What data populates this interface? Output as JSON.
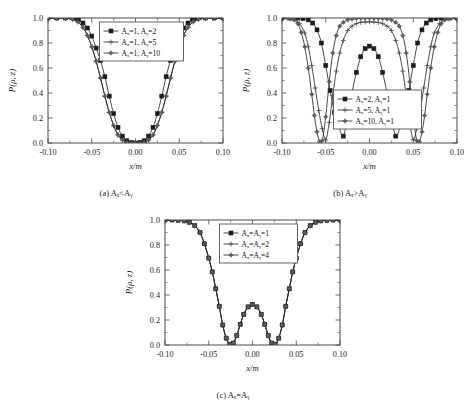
{
  "figure": {
    "background": "#ffffff",
    "line_color": "#2b2b2b",
    "axis_color": "#4a4a4a",
    "bottom_partial_text": ""
  },
  "panels": [
    {
      "id": "a",
      "caption": "(a)  Aₓ<Aᵧ",
      "caption_parts": {
        "tag": "(a)",
        "expr": "Ax<Ay"
      },
      "xlabel": "x/m",
      "ylabel": "P(ρ, z)",
      "xticks": [
        "-0.10",
        "-0.05",
        "0.00",
        "0.05",
        "0.10"
      ],
      "yticks": [
        "0.0",
        "0.2",
        "0.4",
        "0.6",
        "0.8",
        "1.0"
      ],
      "legend": [
        {
          "label": "Aₓ=1, Aᵧ=2",
          "marker": "square"
        },
        {
          "label": "Aₓ=1, Aᵧ=5",
          "marker": "plus"
        },
        {
          "label": "Aₓ=1, Aᵧ=10",
          "marker": "star"
        }
      ]
    },
    {
      "id": "b",
      "caption": "(b)  Aₓ>Aᵧ",
      "caption_parts": {
        "tag": "(b)",
        "expr": "Ax>Ay"
      },
      "xlabel": "x/m",
      "ylabel": "P(ρ, z)",
      "xticks": [
        "-0.10",
        "-0.05",
        "0.00",
        "0.05",
        "0.10"
      ],
      "yticks": [
        "0.0",
        "0.2",
        "0.4",
        "0.6",
        "0.8",
        "1.0"
      ],
      "legend": [
        {
          "label": "Aₓ=2, Aᵧ=1",
          "marker": "square"
        },
        {
          "label": "Aₓ=5, Aᵧ=1",
          "marker": "plus"
        },
        {
          "label": "Aₓ=10, Aᵧ=1",
          "marker": "star"
        }
      ]
    },
    {
      "id": "c",
      "caption": "(c)  Aₓ=Aᵧ",
      "caption_parts": {
        "tag": "(c)",
        "expr": "Ax=Ay"
      },
      "xlabel": "x/m",
      "ylabel": "P(ρ, z)",
      "xticks": [
        "-0.10",
        "-0.05",
        "0.00",
        "0.05",
        "0.10"
      ],
      "yticks": [
        "0.0",
        "0.2",
        "0.4",
        "0.6",
        "0.8",
        "1.0"
      ],
      "legend": [
        {
          "label": "Aₓ=Aᵧ=1",
          "marker": "square"
        },
        {
          "label": "Aₓ=Aᵧ=2",
          "marker": "plus"
        },
        {
          "label": "Aₓ=Aᵧ=4",
          "marker": "star"
        }
      ]
    }
  ],
  "chart_data": [
    {
      "type": "line",
      "panel": "a",
      "title": "(a) Ax<Ay",
      "xlabel": "x/m",
      "ylabel": "P(rho, z)",
      "xlim": [
        -0.1,
        0.1
      ],
      "ylim": [
        0.0,
        1.0
      ],
      "xticks": [
        -0.1,
        -0.05,
        0.0,
        0.05,
        0.1
      ],
      "yticks": [
        0.0,
        0.2,
        0.4,
        0.6,
        0.8,
        1.0
      ],
      "grid": false,
      "legend_position": "top-center",
      "series": [
        {
          "name": "Ax=1, Ay=2",
          "marker": "square",
          "x": [
            -0.1,
            -0.09,
            -0.08,
            -0.07,
            -0.065,
            -0.06,
            -0.055,
            -0.05,
            -0.045,
            -0.04,
            -0.035,
            -0.03,
            -0.025,
            -0.02,
            -0.015,
            -0.01,
            -0.005,
            0.0,
            0.005,
            0.01,
            0.015,
            0.02,
            0.025,
            0.03,
            0.035,
            0.04,
            0.045,
            0.05,
            0.055,
            0.06,
            0.065,
            0.07,
            0.08,
            0.09,
            0.1
          ],
          "y": [
            1.0,
            1.0,
            1.0,
            0.995,
            0.985,
            0.96,
            0.92,
            0.855,
            0.76,
            0.66,
            0.53,
            0.375,
            0.235,
            0.125,
            0.055,
            0.018,
            0.004,
            0.0,
            0.004,
            0.018,
            0.055,
            0.125,
            0.235,
            0.375,
            0.53,
            0.66,
            0.76,
            0.855,
            0.92,
            0.96,
            0.985,
            0.995,
            1.0,
            1.0,
            1.0
          ]
        },
        {
          "name": "Ax=1, Ay=5",
          "marker": "plus",
          "x": [
            -0.1,
            -0.09,
            -0.08,
            -0.072,
            -0.066,
            -0.06,
            -0.055,
            -0.05,
            -0.045,
            -0.04,
            -0.035,
            -0.03,
            -0.025,
            -0.02,
            -0.015,
            -0.01,
            -0.005,
            0.0,
            0.005,
            0.01,
            0.015,
            0.02,
            0.025,
            0.03,
            0.035,
            0.04,
            0.045,
            0.05,
            0.055,
            0.06,
            0.066,
            0.072,
            0.08,
            0.09,
            0.1
          ],
          "y": [
            1.0,
            1.0,
            0.998,
            0.99,
            0.97,
            0.925,
            0.86,
            0.77,
            0.655,
            0.52,
            0.375,
            0.245,
            0.14,
            0.065,
            0.025,
            0.006,
            0.001,
            0.0,
            0.001,
            0.006,
            0.025,
            0.065,
            0.14,
            0.245,
            0.375,
            0.52,
            0.655,
            0.77,
            0.86,
            0.925,
            0.97,
            0.99,
            0.998,
            1.0,
            1.0
          ]
        },
        {
          "name": "Ax=1, Ay=10",
          "marker": "star",
          "x": [
            -0.1,
            -0.09,
            -0.08,
            -0.072,
            -0.066,
            -0.06,
            -0.055,
            -0.05,
            -0.045,
            -0.04,
            -0.035,
            -0.03,
            -0.025,
            -0.02,
            -0.015,
            -0.01,
            -0.005,
            0.0,
            0.005,
            0.01,
            0.015,
            0.02,
            0.025,
            0.03,
            0.035,
            0.04,
            0.045,
            0.05,
            0.055,
            0.06,
            0.066,
            0.072,
            0.08,
            0.09,
            0.1
          ],
          "y": [
            1.0,
            1.0,
            0.998,
            0.99,
            0.97,
            0.925,
            0.86,
            0.77,
            0.655,
            0.52,
            0.375,
            0.245,
            0.14,
            0.065,
            0.025,
            0.006,
            0.001,
            0.0,
            0.001,
            0.006,
            0.025,
            0.065,
            0.14,
            0.245,
            0.375,
            0.52,
            0.655,
            0.77,
            0.86,
            0.925,
            0.97,
            0.99,
            0.998,
            1.0,
            1.0
          ]
        }
      ]
    },
    {
      "type": "line",
      "panel": "b",
      "title": "(b) Ax>Ay",
      "xlabel": "x/m",
      "ylabel": "P(rho, z)",
      "xlim": [
        -0.1,
        0.1
      ],
      "ylim": [
        0.0,
        1.0
      ],
      "xticks": [
        -0.1,
        -0.05,
        0.0,
        0.05,
        0.1
      ],
      "yticks": [
        0.0,
        0.2,
        0.4,
        0.6,
        0.8,
        1.0
      ],
      "grid": false,
      "legend_position": "bottom-center",
      "series": [
        {
          "name": "Ax=2, Ay=1",
          "marker": "square",
          "x": [
            -0.1,
            -0.09,
            -0.082,
            -0.076,
            -0.07,
            -0.065,
            -0.06,
            -0.055,
            -0.05,
            -0.045,
            -0.04,
            -0.035,
            -0.03,
            -0.025,
            -0.02,
            -0.015,
            -0.01,
            -0.005,
            0.0,
            0.005,
            0.01,
            0.015,
            0.02,
            0.025,
            0.03,
            0.035,
            0.04,
            0.045,
            0.05,
            0.055,
            0.06,
            0.065,
            0.07,
            0.076,
            0.082,
            0.09,
            0.1
          ],
          "y": [
            1.0,
            1.0,
            0.999,
            0.995,
            0.985,
            0.96,
            0.905,
            0.8,
            0.62,
            0.42,
            0.245,
            0.13,
            0.055,
            0.21,
            0.4,
            0.565,
            0.69,
            0.755,
            0.775,
            0.755,
            0.69,
            0.565,
            0.4,
            0.21,
            0.055,
            0.13,
            0.245,
            0.42,
            0.62,
            0.8,
            0.905,
            0.96,
            0.985,
            0.995,
            0.999,
            1.0,
            1.0
          ]
        },
        {
          "name": "Ax=5, Ay=1",
          "marker": "plus",
          "x": [
            -0.1,
            -0.092,
            -0.086,
            -0.08,
            -0.074,
            -0.07,
            -0.066,
            -0.062,
            -0.058,
            -0.054,
            -0.05,
            -0.046,
            -0.042,
            -0.038,
            -0.034,
            -0.03,
            -0.025,
            -0.02,
            -0.015,
            -0.01,
            -0.005,
            0.0,
            0.005,
            0.01,
            0.015,
            0.02,
            0.025,
            0.03,
            0.034,
            0.038,
            0.042,
            0.046,
            0.05,
            0.054,
            0.058,
            0.062,
            0.066,
            0.07,
            0.074,
            0.08,
            0.086,
            0.092,
            0.1
          ],
          "y": [
            1.0,
            0.998,
            0.99,
            0.955,
            0.88,
            0.77,
            0.62,
            0.44,
            0.26,
            0.115,
            0.025,
            0.165,
            0.38,
            0.575,
            0.72,
            0.82,
            0.9,
            0.935,
            0.955,
            0.965,
            0.968,
            0.97,
            0.968,
            0.965,
            0.955,
            0.935,
            0.9,
            0.82,
            0.72,
            0.575,
            0.38,
            0.165,
            0.025,
            0.115,
            0.26,
            0.44,
            0.62,
            0.77,
            0.88,
            0.955,
            0.99,
            0.998,
            1.0
          ]
        },
        {
          "name": "Ax=10, Ay=1",
          "marker": "star",
          "x": [
            -0.1,
            -0.094,
            -0.09,
            -0.086,
            -0.082,
            -0.078,
            -0.074,
            -0.07,
            -0.066,
            -0.063,
            -0.06,
            -0.057,
            -0.054,
            -0.05,
            -0.046,
            -0.042,
            -0.038,
            -0.034,
            -0.03,
            -0.025,
            -0.02,
            -0.015,
            -0.01,
            -0.005,
            0.0,
            0.005,
            0.01,
            0.015,
            0.02,
            0.025,
            0.03,
            0.034,
            0.038,
            0.042,
            0.046,
            0.05,
            0.054,
            0.057,
            0.06,
            0.063,
            0.066,
            0.07,
            0.074,
            0.078,
            0.082,
            0.086,
            0.09,
            0.094,
            0.1
          ],
          "y": [
            1.0,
            0.999,
            0.995,
            0.985,
            0.955,
            0.885,
            0.77,
            0.6,
            0.39,
            0.22,
            0.09,
            0.01,
            0.02,
            0.21,
            0.49,
            0.72,
            0.86,
            0.935,
            0.965,
            0.985,
            0.992,
            0.996,
            0.998,
            0.999,
            1.0,
            0.999,
            0.998,
            0.996,
            0.992,
            0.985,
            0.965,
            0.935,
            0.86,
            0.72,
            0.49,
            0.21,
            0.02,
            0.01,
            0.09,
            0.22,
            0.39,
            0.6,
            0.77,
            0.885,
            0.955,
            0.985,
            0.995,
            0.999,
            1.0
          ]
        }
      ]
    },
    {
      "type": "line",
      "panel": "c",
      "title": "(c) Ax=Ay",
      "xlabel": "x/m",
      "ylabel": "P(rho, z)",
      "xlim": [
        -0.1,
        0.1
      ],
      "ylim": [
        0.0,
        1.0
      ],
      "xticks": [
        -0.1,
        -0.05,
        0.0,
        0.05,
        0.1
      ],
      "yticks": [
        0.0,
        0.2,
        0.4,
        0.6,
        0.8,
        1.0
      ],
      "grid": false,
      "legend_position": "top-center",
      "note": "all three curves coincide",
      "series": [
        {
          "name": "Ax=Ay=1",
          "marker": "square",
          "x": [
            -0.1,
            -0.092,
            -0.085,
            -0.078,
            -0.072,
            -0.066,
            -0.06,
            -0.055,
            -0.05,
            -0.046,
            -0.042,
            -0.038,
            -0.034,
            -0.03,
            -0.026,
            -0.022,
            -0.018,
            -0.014,
            -0.01,
            -0.005,
            0.0,
            0.005,
            0.01,
            0.014,
            0.018,
            0.022,
            0.026,
            0.03,
            0.034,
            0.038,
            0.042,
            0.046,
            0.05,
            0.055,
            0.06,
            0.066,
            0.072,
            0.078,
            0.085,
            0.092,
            0.1
          ],
          "y": [
            1.0,
            1.0,
            0.998,
            0.993,
            0.982,
            0.955,
            0.9,
            0.81,
            0.695,
            0.585,
            0.45,
            0.31,
            0.16,
            0.055,
            0.005,
            0.015,
            0.075,
            0.165,
            0.245,
            0.305,
            0.325,
            0.305,
            0.245,
            0.165,
            0.075,
            0.015,
            0.005,
            0.055,
            0.16,
            0.31,
            0.45,
            0.585,
            0.695,
            0.81,
            0.9,
            0.955,
            0.982,
            0.993,
            0.998,
            1.0,
            1.0
          ]
        },
        {
          "name": "Ax=Ay=2",
          "marker": "plus",
          "x": [
            -0.1,
            -0.092,
            -0.085,
            -0.078,
            -0.072,
            -0.066,
            -0.06,
            -0.055,
            -0.05,
            -0.046,
            -0.042,
            -0.038,
            -0.034,
            -0.03,
            -0.026,
            -0.022,
            -0.018,
            -0.014,
            -0.01,
            -0.005,
            0.0,
            0.005,
            0.01,
            0.014,
            0.018,
            0.022,
            0.026,
            0.03,
            0.034,
            0.038,
            0.042,
            0.046,
            0.05,
            0.055,
            0.06,
            0.066,
            0.072,
            0.078,
            0.085,
            0.092,
            0.1
          ],
          "y": [
            1.0,
            1.0,
            0.998,
            0.993,
            0.982,
            0.955,
            0.9,
            0.81,
            0.695,
            0.585,
            0.45,
            0.31,
            0.16,
            0.055,
            0.005,
            0.015,
            0.075,
            0.165,
            0.245,
            0.305,
            0.325,
            0.305,
            0.245,
            0.165,
            0.075,
            0.015,
            0.005,
            0.055,
            0.16,
            0.31,
            0.45,
            0.585,
            0.695,
            0.81,
            0.9,
            0.955,
            0.982,
            0.993,
            0.998,
            1.0,
            1.0
          ]
        },
        {
          "name": "Ax=Ay=4",
          "marker": "star",
          "x": [
            -0.1,
            -0.092,
            -0.085,
            -0.078,
            -0.072,
            -0.066,
            -0.06,
            -0.055,
            -0.05,
            -0.046,
            -0.042,
            -0.038,
            -0.034,
            -0.03,
            -0.026,
            -0.022,
            -0.018,
            -0.014,
            -0.01,
            -0.005,
            0.0,
            0.005,
            0.01,
            0.014,
            0.018,
            0.022,
            0.026,
            0.03,
            0.034,
            0.038,
            0.042,
            0.046,
            0.05,
            0.055,
            0.06,
            0.066,
            0.072,
            0.078,
            0.085,
            0.092,
            0.1
          ],
          "y": [
            1.0,
            1.0,
            0.998,
            0.993,
            0.982,
            0.955,
            0.9,
            0.81,
            0.695,
            0.585,
            0.45,
            0.31,
            0.16,
            0.055,
            0.005,
            0.015,
            0.075,
            0.165,
            0.245,
            0.305,
            0.325,
            0.305,
            0.245,
            0.165,
            0.075,
            0.015,
            0.005,
            0.055,
            0.16,
            0.31,
            0.45,
            0.585,
            0.695,
            0.81,
            0.9,
            0.955,
            0.982,
            0.993,
            0.998,
            1.0,
            1.0
          ]
        }
      ]
    }
  ]
}
